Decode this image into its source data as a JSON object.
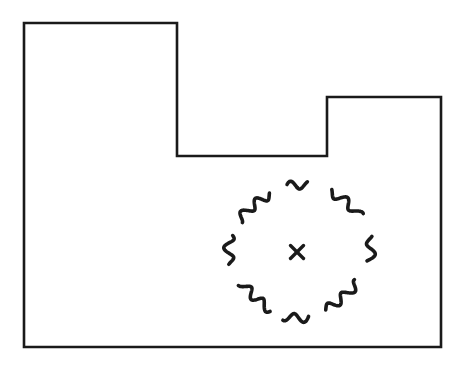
{
  "figure": {
    "background_color": "#ffffff",
    "ink_color": "#1a1a1a",
    "width": 461,
    "height": 371
  },
  "boundary": {
    "name": "lot-outline",
    "shape": "L-shaped polygon with stepped top edge",
    "stroke_color": "#1a1a1a",
    "stroke_width": 2.6,
    "points": [
      [
        24,
        23
      ],
      [
        177,
        23
      ],
      [
        177,
        156
      ],
      [
        327,
        156
      ],
      [
        327,
        97
      ],
      [
        441,
        97
      ],
      [
        441,
        347
      ],
      [
        24,
        347
      ]
    ],
    "closed": true
  },
  "blob": {
    "name": "tree-canopy-outline",
    "style": "wavy scalloped dashed contour",
    "stroke_color": "#1a1a1a",
    "stroke_width": 3.6,
    "center": [
      297,
      251
    ],
    "radius": 67,
    "scallop_count": 22,
    "scallop_amplitude": 4.5,
    "gap_segments": 8
  },
  "marker": {
    "name": "center-cross-marker",
    "symbol": "x",
    "stroke_color": "#1a1a1a",
    "stroke_width": 3.4,
    "center": [
      297,
      252
    ],
    "size": 13
  }
}
